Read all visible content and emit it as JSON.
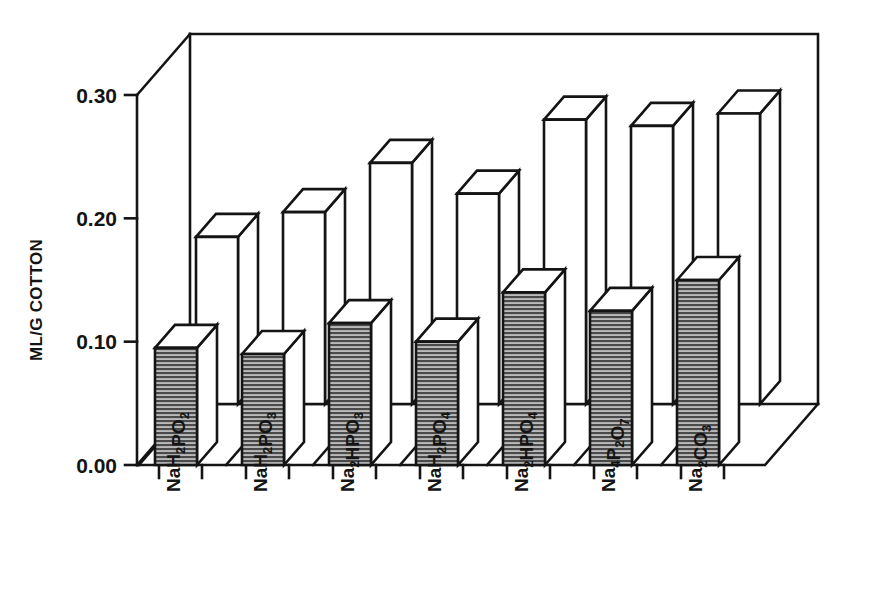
{
  "chart_data": {
    "type": "bar",
    "title": "",
    "subtitle": "",
    "xlabel": "",
    "ylabel": "ML/G COTTON",
    "ylim": [
      0.0,
      0.3
    ],
    "ytick_labels": [
      "0.00",
      "0.10",
      "0.20",
      "0.30"
    ],
    "ytick_values": [
      0.0,
      0.1,
      0.2,
      0.3
    ],
    "grid": false,
    "legend": null,
    "legend_position": "none",
    "projection": "3d-two-row",
    "categories": [
      "NaH2PO2",
      "NaH2PO3",
      "Na2HPO3",
      "NaH2PO4",
      "Na2HPO4",
      "Na4P2O7",
      "Na2CO3"
    ],
    "categories_formatted": [
      [
        {
          "t": "NaH",
          "sub": false
        },
        {
          "t": "2",
          "sub": true
        },
        {
          "t": "PO",
          "sub": false
        },
        {
          "t": "2",
          "sub": true
        }
      ],
      [
        {
          "t": "NaH",
          "sub": false
        },
        {
          "t": "2",
          "sub": true
        },
        {
          "t": "PO",
          "sub": false
        },
        {
          "t": "3",
          "sub": true
        }
      ],
      [
        {
          "t": "Na",
          "sub": false
        },
        {
          "t": "2",
          "sub": true
        },
        {
          "t": "HPO",
          "sub": false
        },
        {
          "t": "3",
          "sub": true
        }
      ],
      [
        {
          "t": "NaH",
          "sub": false
        },
        {
          "t": "2",
          "sub": true
        },
        {
          "t": "PO",
          "sub": false
        },
        {
          "t": "4",
          "sub": true
        }
      ],
      [
        {
          "t": "Na",
          "sub": false
        },
        {
          "t": "2",
          "sub": true
        },
        {
          "t": "HPO",
          "sub": false
        },
        {
          "t": "4",
          "sub": true
        }
      ],
      [
        {
          "t": "Na",
          "sub": false
        },
        {
          "t": "4",
          "sub": true
        },
        {
          "t": "P",
          "sub": false
        },
        {
          "t": "2",
          "sub": true
        },
        {
          "t": "O",
          "sub": false
        },
        {
          "t": "7",
          "sub": true
        }
      ],
      [
        {
          "t": "Na",
          "sub": false
        },
        {
          "t": "2",
          "sub": true
        },
        {
          "t": "CO",
          "sub": false
        },
        {
          "t": "3",
          "sub": true
        }
      ]
    ],
    "series": [
      {
        "name": "back-row",
        "style": "white",
        "values": [
          0.185,
          0.205,
          0.245,
          0.22,
          0.28,
          0.275,
          0.285
        ]
      },
      {
        "name": "front-row",
        "style": "gray-hatched",
        "values": [
          0.095,
          0.09,
          0.115,
          0.1,
          0.14,
          0.125,
          0.15
        ]
      }
    ]
  },
  "colors": {
    "ink": "#141414",
    "bar_white_face": "#ffffff",
    "bar_white_top": "#ffffff",
    "bar_white_side": "#ffffff",
    "bar_gray_face": "#8a8a8a",
    "bar_gray_top": "#e8e8e8",
    "bar_gray_side": "#c4c4c4",
    "background": "#ffffff"
  }
}
